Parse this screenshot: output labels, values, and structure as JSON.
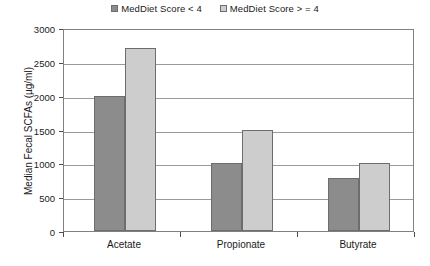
{
  "chart_data": {
    "type": "bar",
    "title": "",
    "xlabel": "",
    "ylabel": "Median Fecal SCFAs (µg/ml)",
    "categories": [
      "Acetate",
      "Propionate",
      "Butyrate"
    ],
    "series": [
      {
        "name": "MedDiet Score < 4",
        "values": [
          2000,
          1000,
          790
        ],
        "color": "#8c8c8c"
      },
      {
        "name": "MedDiet Score > = 4",
        "values": [
          2700,
          1490,
          1000
        ],
        "color": "#cdcdcd"
      }
    ],
    "ylim": [
      0,
      3000
    ],
    "ytick_labels": [
      "3000",
      "2500",
      "2000",
      "1500",
      "1000",
      "500",
      "0"
    ],
    "ytick_values": [
      3000,
      2500,
      2000,
      1500,
      1000,
      500,
      0
    ],
    "grid": true,
    "legend_position": "top-center"
  },
  "legend": {
    "items": [
      {
        "label": "MedDiet Score < 4",
        "swatch": "dark-gray-swatch"
      },
      {
        "label": "MedDiet Score > = 4",
        "swatch": "light-gray-swatch"
      }
    ]
  }
}
